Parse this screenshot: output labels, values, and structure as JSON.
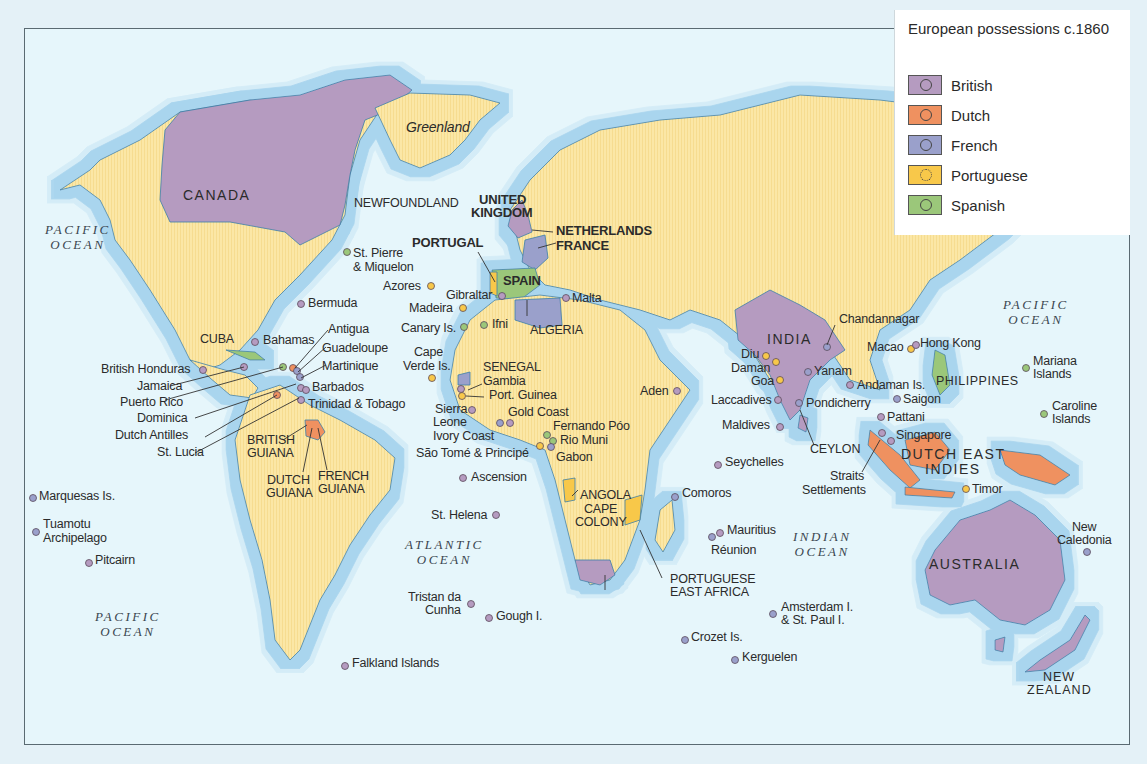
{
  "legend": {
    "title": "European possessions c.1860",
    "items": [
      {
        "label": "British",
        "color": "#b59bc0"
      },
      {
        "label": "Dutch",
        "color": "#ef9160"
      },
      {
        "label": "French",
        "color": "#9aa0cb"
      },
      {
        "label": "Portuguese",
        "color": "#f8c84a"
      },
      {
        "label": "Spanish",
        "color": "#9bc77a"
      }
    ]
  },
  "colors": {
    "ocean": "#e6f6fb",
    "shelf": "#a9d5ee",
    "land": "#fbe7a6",
    "british": "#b59bc0",
    "dutch": "#ef9160",
    "french": "#9aa0cb",
    "portuguese": "#f8c84a",
    "spanish": "#9bc77a"
  },
  "oceans": [
    {
      "name": "pacific-ocean-north-west",
      "line1": "PACIFIC",
      "line2": "OCEAN"
    },
    {
      "name": "pacific-ocean-north-east",
      "line1": "PACIFIC",
      "line2": "OCEAN"
    },
    {
      "name": "pacific-ocean-south",
      "line1": "PACIFIC",
      "line2": "OCEAN"
    },
    {
      "name": "atlantic-ocean",
      "line1": "ATLANTIC",
      "line2": "OCEAN"
    },
    {
      "name": "indian-ocean",
      "line1": "INDIAN",
      "line2": "OCEAN"
    }
  ],
  "regions": {
    "canada": "CANADA",
    "greenland": "Greenland",
    "newfoundland": "NEWFOUNDLAND",
    "united_kingdom_1": "UNITED",
    "united_kingdom_2": "KINGDOM",
    "netherlands": "NETHERLANDS",
    "france": "FRANCE",
    "portugal": "PORTUGAL",
    "spain": "SPAIN",
    "algeria": "ALGERIA",
    "india": "INDIA",
    "australia": "AUSTRALIA",
    "new_zealand_1": "NEW",
    "new_zealand_2": "ZEALAND",
    "dutch_east_indies_1": "DUTCH EAST",
    "dutch_east_indies_2": "INDIES",
    "philippines": "PHILIPPINES",
    "cuba": "CUBA",
    "senegal": "SENEGAL",
    "angola": "ANGOLA",
    "cape_colony_1": "CAPE",
    "cape_colony_2": "COLONY",
    "portuguese_east_africa_1": "PORTUGUESE",
    "portuguese_east_africa_2": "EAST AFRICA",
    "british_guiana_1": "BRITISH",
    "british_guiana_2": "GUIANA",
    "dutch_guiana_1": "DUTCH",
    "dutch_guiana_2": "GUIANA",
    "french_guiana_1": "FRENCH",
    "french_guiana_2": "GUIANA",
    "ceylon": "CEYLON"
  },
  "places": [
    {
      "label": "St. Pierre",
      "label2": "& Miquelon",
      "owner": "french"
    },
    {
      "label": "Bermuda",
      "owner": "british"
    },
    {
      "label": "Azores",
      "owner": "portuguese"
    },
    {
      "label": "Madeira",
      "owner": "portuguese"
    },
    {
      "label": "Gibraltar",
      "owner": "british"
    },
    {
      "label": "Canary Is.",
      "owner": "spanish"
    },
    {
      "label": "Ifni",
      "owner": "spanish"
    },
    {
      "label": "Malta",
      "owner": "british"
    },
    {
      "label": "Bahamas",
      "owner": "british"
    },
    {
      "label": "Antigua",
      "owner": "british"
    },
    {
      "label": "Guadeloupe",
      "owner": "french"
    },
    {
      "label": "Martinique",
      "owner": "french"
    },
    {
      "label": "Barbados",
      "owner": "british"
    },
    {
      "label": "Trinidad & Tobago",
      "owner": "british"
    },
    {
      "label": "British Honduras",
      "owner": "british"
    },
    {
      "label": "Jamaica",
      "owner": "british"
    },
    {
      "label": "Puerto Rico",
      "owner": "spanish"
    },
    {
      "label": "Dominica",
      "owner": "british"
    },
    {
      "label": "Dutch Antilles",
      "owner": "dutch"
    },
    {
      "label": "St. Lucia",
      "owner": "british"
    },
    {
      "label": "Cape",
      "label2": "Verde Is.",
      "owner": "portuguese"
    },
    {
      "label": "Gambia",
      "owner": "british"
    },
    {
      "label": "Port. Guinea",
      "owner": "portuguese"
    },
    {
      "label": "Sierra",
      "label2": "Leone",
      "owner": "british"
    },
    {
      "label": "Gold Coast",
      "owner": "british"
    },
    {
      "label": "Ivory Coast",
      "owner": "french"
    },
    {
      "label": "Fernando Póo",
      "owner": "spanish"
    },
    {
      "label": "Rio Muni",
      "owner": "spanish"
    },
    {
      "label": "São Tomé & Principé",
      "owner": "portuguese"
    },
    {
      "label": "Gabon",
      "owner": "french"
    },
    {
      "label": "Ascension",
      "owner": "british"
    },
    {
      "label": "St. Helena",
      "owner": "british"
    },
    {
      "label": "Tristan da",
      "label2": "Cunha",
      "owner": "british"
    },
    {
      "label": "Gough I.",
      "owner": "british"
    },
    {
      "label": "Falkland Islands",
      "owner": "british"
    },
    {
      "label": "Marquesas Is.",
      "owner": "french"
    },
    {
      "label": "Tuamotu",
      "label2": "Archipelago",
      "owner": "french"
    },
    {
      "label": "Pitcairn",
      "owner": "british"
    },
    {
      "label": "Aden",
      "owner": "british"
    },
    {
      "label": "Comoros",
      "owner": "french"
    },
    {
      "label": "Mauritius",
      "owner": "british"
    },
    {
      "label": "Réunion",
      "owner": "french"
    },
    {
      "label": "Seychelles",
      "owner": "british"
    },
    {
      "label": "Amsterdam I.",
      "label2": "& St. Paul I.",
      "owner": "french"
    },
    {
      "label": "Crozet Is.",
      "owner": "french"
    },
    {
      "label": "Kerguelen",
      "owner": "french"
    },
    {
      "label": "Diu",
      "owner": "portuguese"
    },
    {
      "label": "Daman",
      "owner": "portuguese"
    },
    {
      "label": "Goa",
      "owner": "portuguese"
    },
    {
      "label": "Laccadives",
      "owner": "british"
    },
    {
      "label": "Maldives",
      "owner": "british"
    },
    {
      "label": "Chandannagar",
      "owner": "french"
    },
    {
      "label": "Yanam",
      "owner": "french"
    },
    {
      "label": "Pondicherry",
      "owner": "french"
    },
    {
      "label": "Andaman Is.",
      "owner": "british"
    },
    {
      "label": "Macao",
      "owner": "portuguese"
    },
    {
      "label": "Hong Kong",
      "owner": "british"
    },
    {
      "label": "Saigon",
      "owner": "french"
    },
    {
      "label": "Pattani",
      "owner": "british"
    },
    {
      "label": "Singapore",
      "owner": "british"
    },
    {
      "label": "Straits",
      "label2": "Settlements",
      "owner": "british"
    },
    {
      "label": "Timor",
      "owner": "portuguese"
    },
    {
      "label": "Mariana",
      "label2": "Islands",
      "owner": "spanish"
    },
    {
      "label": "Caroline",
      "label2": "Islands",
      "owner": "spanish"
    },
    {
      "label": "New",
      "label2": "Caledonia",
      "owner": "french"
    }
  ]
}
